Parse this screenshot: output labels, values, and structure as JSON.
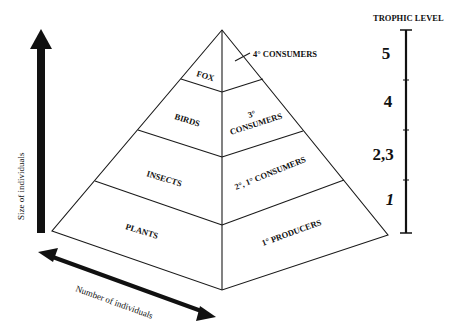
{
  "colors": {
    "ink": "#111111",
    "background": "#ffffff"
  },
  "axes": {
    "vertical_label": "Size of individuals",
    "horizontal_label": "Number of individuals"
  },
  "pyramid": {
    "left_face_tiers": [
      {
        "label": "FOX"
      },
      {
        "label": "BIRDS"
      },
      {
        "label": "INSECTS"
      },
      {
        "label": "PLANTS"
      }
    ],
    "right_face_tiers": [
      {
        "label": "4° CONSUMERS"
      },
      {
        "label_line1": "3°",
        "label_line2": "CONSUMERS"
      },
      {
        "label": "2°, 1° CONSUMERS"
      },
      {
        "label": "1° PRODUCERS"
      }
    ]
  },
  "trophic_scale": {
    "title": "TROPHIC LEVEL",
    "levels": [
      "5",
      "4",
      "2,3",
      "1"
    ]
  }
}
